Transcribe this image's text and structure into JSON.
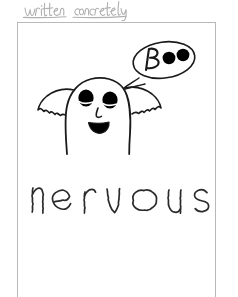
{
  "page": {
    "width": 238,
    "height": 289,
    "background_color": "#ffffff"
  },
  "annotation": {
    "text": "written concretely",
    "style": "handwritten-cursive",
    "color": "#b0b0b2",
    "position": "above-card"
  },
  "card": {
    "border_color": "#b9b9bb",
    "background_color": "#ffffff",
    "open_edge": "bottom"
  },
  "illustration": {
    "name": "ghost-with-speech-bubble",
    "ink_color": "#1a1a1a",
    "fill_color": "#000000",
    "ghost": {
      "label": "ghost",
      "eyes": 2,
      "eye_style": "filled-oval-with-lid",
      "nose": "angular-line",
      "mouth": "open-filled-oval",
      "arms": 2,
      "arm_edge": "zigzag",
      "body_bottom": "open"
    },
    "speech_bubble": {
      "label": "speech-bubble",
      "shape": "ellipse",
      "text": "Boo",
      "letter": "B",
      "dots": 2,
      "tail_direction": "down-left"
    }
  },
  "word_art": {
    "text": "nervous",
    "letters": [
      "n",
      "e",
      "r",
      "v",
      "o",
      "u",
      "s"
    ],
    "style": "shaky-wobbly-outline",
    "ink_color": "#2a2a2a",
    "meaning": "nervous"
  }
}
